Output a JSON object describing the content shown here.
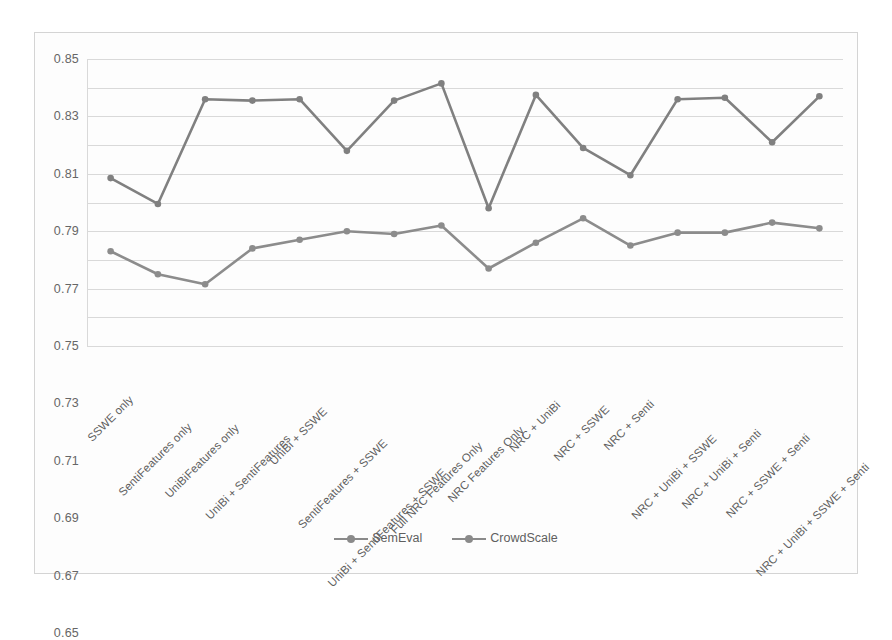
{
  "chart_data": {
    "type": "line",
    "title": "",
    "xlabel": "",
    "ylabel": "",
    "ylim": [
      0.65,
      0.85
    ],
    "ytick_step": 0.02,
    "yticks": [
      "0.85",
      "0.83",
      "0.81",
      "0.79",
      "0.77",
      "0.75",
      "0.73",
      "0.71",
      "0.69",
      "0.67",
      "0.65"
    ],
    "grid": true,
    "legend_position": "bottom-center",
    "categories": [
      "SSWE only",
      "SentiFeatures only",
      "UniBiFeatures only",
      "UniBi + SentiFeatures",
      "UniBi + SSWE",
      "SentiFeatures + SSWE",
      "UniBi + SentiFeatures + SSWE",
      "Full NRC Features Only",
      "NRC Features Only",
      "NRC + UniBi",
      "NRC + SSWE",
      "NRC + Senti",
      "NRC + UniBi + SSWE",
      "NRC + UniBi + Senti",
      "NRC + SSWE + Senti",
      "NRC + UniBi + SSWE + Senti"
    ],
    "series": [
      {
        "name": "SemEval",
        "color": "#808080",
        "values": [
          0.767,
          0.749,
          0.822,
          0.821,
          0.822,
          0.786,
          0.821,
          0.833,
          0.746,
          0.825,
          0.788,
          0.769,
          0.822,
          0.823,
          0.792,
          0.824
        ]
      },
      {
        "name": "CrowdScale",
        "color": "#8c8c8c",
        "values": [
          0.716,
          0.7,
          0.693,
          0.718,
          0.724,
          0.73,
          0.728,
          0.734,
          0.704,
          0.722,
          0.739,
          0.72,
          0.729,
          0.729,
          0.736,
          0.732
        ]
      }
    ]
  },
  "legend": {
    "items": [
      {
        "label": "SemEval"
      },
      {
        "label": "CrowdScale"
      }
    ]
  }
}
